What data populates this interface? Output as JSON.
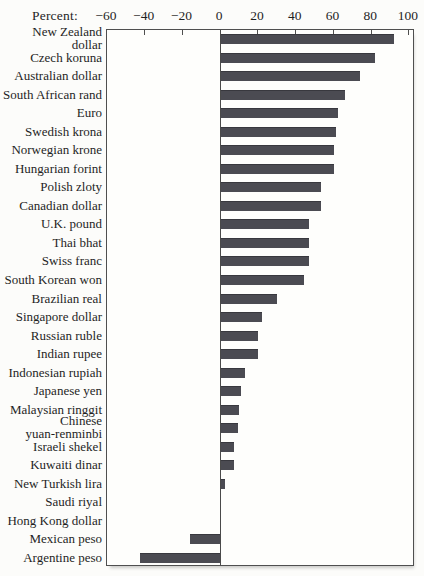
{
  "header": {
    "percent_label": "Percent:"
  },
  "chart_data": {
    "type": "bar",
    "orientation": "horizontal",
    "title": "",
    "xlabel": "Percent",
    "ylabel": "",
    "xlim": [
      -60,
      100
    ],
    "x_ticks": [
      -60,
      -40,
      -20,
      0,
      20,
      40,
      60,
      80,
      100
    ],
    "x_tick_labels": [
      "−60",
      "−40",
      "−20",
      "0",
      "20",
      "40",
      "60",
      "80",
      "100"
    ],
    "grid": false,
    "legend_position": "none",
    "zero_baseline": true,
    "categories": [
      "New Zealand dollar",
      "Czech koruna",
      "Australian dollar",
      "South African rand",
      "Euro",
      "Swedish krona",
      "Norwegian krone",
      "Hungarian forint",
      "Polish zloty",
      "Canadian dollar",
      "U.K. pound",
      "Thai bhat",
      "Swiss franc",
      "South Korean won",
      "Brazilian real",
      "Singapore dollar",
      "Russian ruble",
      "Indian rupee",
      "Indonesian rupiah",
      "Japanese yen",
      "Malaysian ringgit",
      "Chinese\nyuan-renminbi",
      "Israeli shekel",
      "Kuwaiti dinar",
      "New Turkish lira",
      "Saudi riyal",
      "Hong Kong dollar",
      "Mexican peso",
      "Argentine peso"
    ],
    "values": [
      92,
      82,
      74,
      66,
      62,
      61,
      60,
      60,
      53,
      53,
      47,
      47,
      47,
      44,
      30,
      22,
      20,
      20,
      13,
      10.5,
      9.5,
      9,
      7,
      7,
      2.5,
      0,
      0,
      -16,
      -42
    ]
  },
  "style": {
    "bar_color": "#4b4b52",
    "axis_color": "#4f4f4f",
    "text_color": "#1f1f1f",
    "background": "#fcfcfa"
  }
}
